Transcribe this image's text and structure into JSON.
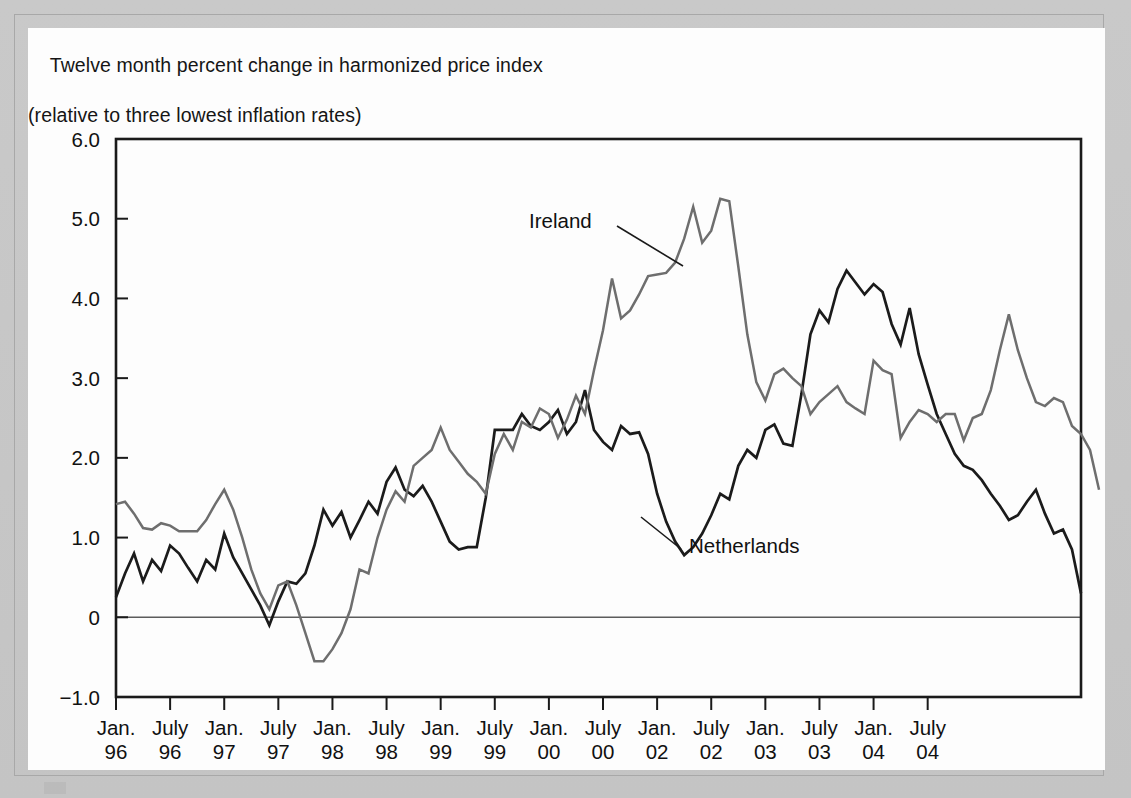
{
  "figure": {
    "title_line1": "Twelve month percent change in harmonized price index",
    "title_line2": "(relative to three lowest inflation rates)"
  },
  "chart_data": {
    "type": "line",
    "title": "Twelve month percent change in harmonized price index (relative to three lowest inflation rates)",
    "xlabel": "",
    "ylabel": "",
    "ylim": [
      -1.0,
      6.0
    ],
    "grid": false,
    "legend_position": "inline-annotation",
    "y_ticks": [
      "6.0",
      "5.0",
      "4.0",
      "3.0",
      "2.0",
      "1.0",
      "0",
      "-1.0"
    ],
    "y_tick_values": [
      6.0,
      5.0,
      4.0,
      3.0,
      2.0,
      1.0,
      0,
      -1.0
    ],
    "x_tick_labels": [
      {
        "month": "Jan.",
        "year": "96"
      },
      {
        "month": "July",
        "year": "96"
      },
      {
        "month": "Jan.",
        "year": "97"
      },
      {
        "month": "July",
        "year": "97"
      },
      {
        "month": "Jan.",
        "year": "98"
      },
      {
        "month": "July",
        "year": "98"
      },
      {
        "month": "Jan.",
        "year": "99"
      },
      {
        "month": "July",
        "year": "99"
      },
      {
        "month": "Jan.",
        "year": "00"
      },
      {
        "month": "July",
        "year": "00"
      },
      {
        "month": "Jan.",
        "year": "02"
      },
      {
        "month": "July",
        "year": "02"
      },
      {
        "month": "Jan.",
        "year": "03"
      },
      {
        "month": "July",
        "year": "03"
      },
      {
        "month": "Jan.",
        "year": "04"
      },
      {
        "month": "July",
        "year": "04"
      }
    ],
    "x_index_range": [
      0,
      107
    ],
    "series": [
      {
        "name": "Netherlands",
        "color": "#1b1b1b",
        "label_x_index": 63,
        "values": [
          0.25,
          0.55,
          0.8,
          0.45,
          0.72,
          0.58,
          0.9,
          0.8,
          0.62,
          0.45,
          0.72,
          0.6,
          1.05,
          0.75,
          0.55,
          0.35,
          0.15,
          -0.1,
          0.2,
          0.45,
          0.42,
          0.55,
          0.9,
          1.35,
          1.15,
          1.32,
          1.0,
          1.22,
          1.45,
          1.3,
          1.7,
          1.88,
          1.6,
          1.52,
          1.65,
          1.45,
          1.2,
          0.95,
          0.85,
          0.88,
          0.88,
          1.5,
          2.35,
          2.35,
          2.35,
          2.55,
          2.4,
          2.35,
          2.45,
          2.6,
          2.3,
          2.45,
          2.85,
          2.35,
          2.2,
          2.1,
          2.4,
          2.3,
          2.32,
          2.05,
          1.55,
          1.2,
          0.95,
          0.78,
          0.88,
          1.05,
          1.28,
          1.55,
          1.48,
          1.9,
          2.1,
          2.0,
          2.35,
          2.42,
          2.18,
          2.15,
          2.8,
          3.55,
          3.85,
          3.7,
          4.12,
          4.35,
          4.2,
          4.05,
          4.18,
          4.08,
          3.68,
          3.42,
          3.88,
          3.3,
          2.92,
          2.55,
          2.3,
          2.05,
          1.9,
          1.85,
          1.72,
          1.55,
          1.4,
          1.22,
          1.28,
          1.45,
          1.6,
          1.3,
          1.05,
          1.1,
          0.85,
          0.3
        ]
      },
      {
        "name": "Ireland",
        "color": "#6e6e6e",
        "label_x_index": 48,
        "values": [
          1.42,
          1.45,
          1.3,
          1.12,
          1.1,
          1.18,
          1.15,
          1.08,
          1.08,
          1.08,
          1.22,
          1.42,
          1.6,
          1.35,
          1.0,
          0.6,
          0.3,
          0.1,
          0.4,
          0.45,
          0.15,
          -0.2,
          -0.55,
          -0.55,
          -0.4,
          -0.2,
          0.1,
          0.6,
          0.55,
          1.0,
          1.35,
          1.58,
          1.45,
          1.9,
          2.0,
          2.1,
          2.38,
          2.1,
          1.95,
          1.8,
          1.7,
          1.55,
          2.05,
          2.3,
          2.1,
          2.45,
          2.38,
          2.62,
          2.55,
          2.25,
          2.48,
          2.78,
          2.55,
          3.1,
          3.6,
          4.25,
          3.75,
          3.85,
          4.05,
          4.28,
          4.3,
          4.32,
          4.45,
          4.75,
          5.15,
          4.7,
          4.85,
          5.25,
          5.22,
          4.4,
          3.55,
          2.95,
          2.72,
          3.05,
          3.12,
          3.0,
          2.9,
          2.55,
          2.7,
          2.8,
          2.9,
          2.7,
          2.62,
          2.55,
          3.22,
          3.1,
          3.05,
          2.25,
          2.45,
          2.6,
          2.55,
          2.45,
          2.55,
          2.55,
          2.22,
          2.5,
          2.55,
          2.85,
          3.35,
          3.8,
          3.35,
          3.0,
          2.7,
          2.65,
          2.75,
          2.7,
          2.4,
          2.3,
          2.1,
          1.6
        ]
      }
    ],
    "annotations": [
      {
        "name": "Ireland",
        "text": "Ireland"
      },
      {
        "name": "Netherlands",
        "text": "Netherlands"
      }
    ]
  }
}
